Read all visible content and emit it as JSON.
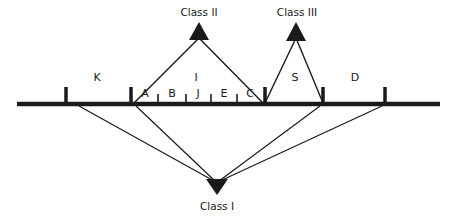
{
  "diagram": {
    "type": "classification-tree",
    "colors": {
      "ink": "#1a1a1a",
      "background": "#ffffff"
    },
    "classes": [
      {
        "id": "class-1",
        "label": "Class I",
        "orientation": "down",
        "connects_to": [
          "K",
          "A",
          "S",
          "D"
        ]
      },
      {
        "id": "class-2",
        "label": "Class II",
        "orientation": "up",
        "connects_to": [
          "A",
          "C"
        ]
      },
      {
        "id": "class-3",
        "label": "Class III",
        "orientation": "up",
        "connects_to": [
          "C",
          "S"
        ]
      }
    ],
    "segments": {
      "K": "K",
      "I": "I",
      "S": "S",
      "D": "D"
    },
    "subsegments": {
      "A": "A",
      "B": "B",
      "J": "J",
      "E": "E",
      "C": "C"
    }
  }
}
